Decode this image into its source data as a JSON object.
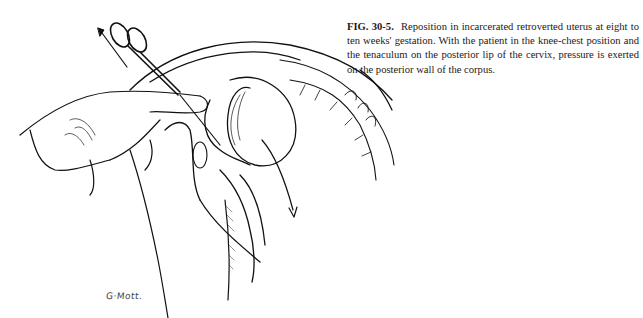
{
  "figure": {
    "label": "FIG. 30-5.",
    "caption": "Reposition in incarcerated retroverted uterus at eight to ten weeks' gestation. With the patient in the knee-chest position and the tenaculum on the posterior lip of the cervix, pressure is exerted on the posterior wall of the corpus.",
    "illustration": "line-drawing-knee-chest-uterine-reposition",
    "signature": "G·Mott."
  }
}
